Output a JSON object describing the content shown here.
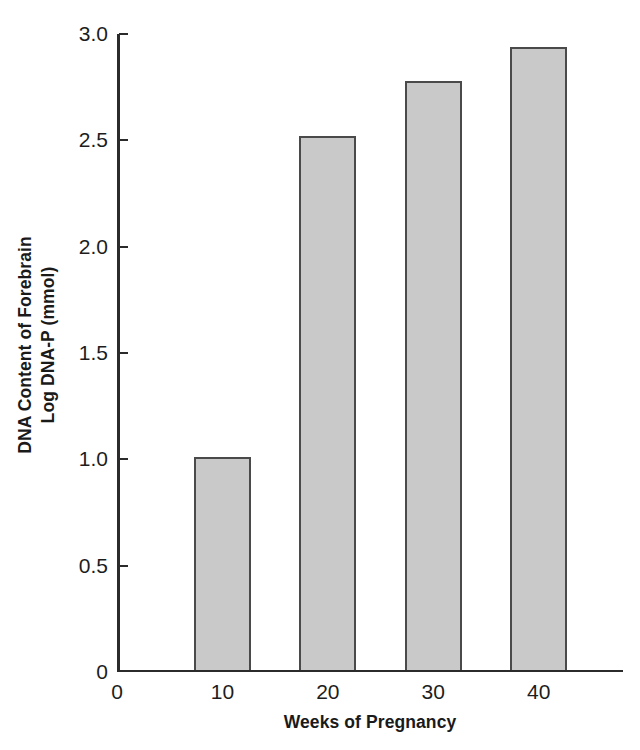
{
  "chart_data": {
    "type": "bar",
    "title": "",
    "subtitle": "",
    "xlabel": "Weeks of Pregnancy",
    "ylabel": "DNA Content of Forebrain Log DNA-P (mmol)",
    "ylabel_line1": "DNA Content of Forebrain",
    "ylabel_line2": "Log DNA-P (mmol)",
    "categories": [
      "10",
      "20",
      "30",
      "40"
    ],
    "values": [
      1.0,
      2.51,
      2.77,
      2.93
    ],
    "series": [
      {
        "name": "Log DNA-P (mmol)",
        "values": [
          1.0,
          2.51,
          2.77,
          2.93
        ]
      }
    ],
    "xlim": [
      0,
      48
    ],
    "ylim": [
      0,
      3.0
    ],
    "x_positions": [
      10,
      20,
      30,
      40
    ],
    "xticks": [
      "0",
      "10",
      "20",
      "30",
      "40"
    ],
    "xtick_values": [
      0,
      10,
      20,
      30,
      40
    ],
    "yticks": [
      "0",
      "0.5",
      "1.0",
      "1.5",
      "2.0",
      "2.5",
      "3.0"
    ],
    "ytick_values": [
      0,
      0.5,
      1.0,
      1.5,
      2.0,
      2.5,
      3.0
    ],
    "grid": false,
    "legend": false,
    "legend_position": "none",
    "bar_width_weeks": 5.4,
    "colors": {
      "bar_fill": "#c9c9c9",
      "bar_edge": "#4a4a4a",
      "axis": "#2b2b2b",
      "text": "#1a1a1a",
      "background": "#ffffff"
    }
  }
}
